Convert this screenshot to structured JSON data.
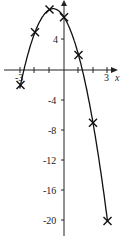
{
  "chart_data": {
    "type": "line",
    "title": "",
    "xlabel": "x",
    "ylabel": "y",
    "x": [
      -3,
      -2,
      -1,
      0,
      1,
      2,
      3
    ],
    "series": [
      {
        "name": "y = -2x^2 - 3x + 7",
        "values": [
          -2,
          5,
          8,
          7,
          2,
          -7,
          -20
        ],
        "marker": "x"
      }
    ],
    "x_tick_labels": [
      "-3",
      "3"
    ],
    "y_tick_labels": [
      "4",
      "-4",
      "-8",
      "-12",
      "-16",
      "-20"
    ],
    "xlim": [
      -3.5,
      3.6
    ],
    "ylim": [
      -21,
      9
    ],
    "grid": false,
    "legend": "none"
  },
  "labels": {
    "x_axis": "x",
    "x_tick_left": "-3",
    "x_tick_right": "3",
    "y4": "4",
    "yn4": "-4",
    "yn8": "-8",
    "yn12": "-12",
    "yn16": "-16",
    "yn20": "-20"
  }
}
